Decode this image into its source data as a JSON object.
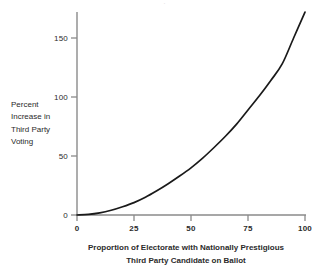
{
  "chart_data": {
    "type": "line",
    "title": "",
    "xlabel": "Proportion of Electorate with Nationally Prestigious Third Party Candidate on Ballot",
    "ylabel": "Percent Increase in Third Party Voting",
    "xlim": [
      0,
      100
    ],
    "ylim": [
      0,
      175
    ],
    "grid": false,
    "legend": "none",
    "x_ticks": [
      "0",
      "25",
      "50",
      "75",
      "100"
    ],
    "x_tick_values": [
      0,
      25,
      50,
      75,
      100
    ],
    "y_ticks": [
      "0",
      "50",
      "100",
      "150"
    ],
    "y_tick_values": [
      0,
      50,
      100,
      150
    ],
    "x": [
      0,
      5,
      10,
      15,
      20,
      25,
      30,
      35,
      40,
      45,
      50,
      55,
      60,
      65,
      70,
      75,
      80,
      85,
      90,
      95,
      100
    ],
    "values": [
      0,
      0.5,
      1.8,
      4,
      7,
      10.5,
      15,
      20.5,
      26.5,
      33,
      40,
      48,
      57,
      66.5,
      77,
      89,
      101,
      114,
      128,
      150,
      172
    ],
    "series": [
      {
        "name": "Percent Increase in Third Party Voting",
        "values": [
          0,
          0.5,
          1.8,
          4,
          7,
          10.5,
          15,
          20.5,
          26.5,
          33,
          40,
          48,
          57,
          66.5,
          77,
          89,
          101,
          114,
          128,
          150,
          172
        ]
      }
    ],
    "annotations": []
  },
  "axes": {
    "y_label_lines": [
      "Percent",
      "Increase in",
      "Third Party",
      "Voting"
    ],
    "x_caption_lines": [
      "Proportion of Electorate with Nationally Prestigious",
      "Third Party Candidate on Ballot"
    ],
    "y_tick_labels": [
      "150",
      "100",
      "50",
      "0"
    ],
    "x_tick_labels": [
      "0",
      "25",
      "50",
      "75",
      "100"
    ]
  },
  "colors": {
    "curve": "#1a1a1a",
    "axis": "#8a8a8a",
    "text": "#2b2b2b",
    "background": "#ffffff"
  },
  "top_artifact": "."
}
